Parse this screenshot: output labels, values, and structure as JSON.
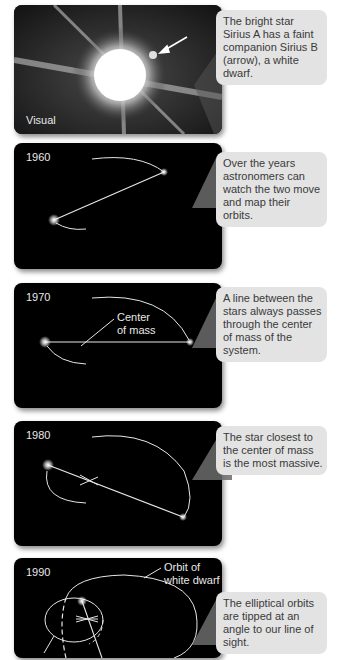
{
  "panels": [
    {
      "id": "visual",
      "label": "Visual",
      "callout": "The bright star Sirius A has a faint companion Sirius B (arrow), a white dwarf."
    },
    {
      "id": "1960",
      "label": "1960",
      "callout": "Over the years astronomers can watch the two move and map their orbits."
    },
    {
      "id": "1970",
      "label": "1970",
      "annotation": "Center of mass",
      "annotation_line1": "Center",
      "annotation_line2": "of mass",
      "callout": "A line between the stars always passes through the center of mass of the system."
    },
    {
      "id": "1980",
      "label": "1980",
      "callout": "The star closest to the center of mass is the most massive."
    },
    {
      "id": "1990",
      "label": "1990",
      "annotation": "Orbit of white dwarf",
      "annotation_line1": "Orbit of",
      "annotation_line2": "white dwarf",
      "callout": "The elliptical orbits are tipped at an angle to our line of sight."
    }
  ],
  "colors": {
    "panel_bg": "#000000",
    "callout_bg": "#e3e3e3",
    "callout_text": "#3a3a3a",
    "orbit_line": "#e6e6e6"
  }
}
